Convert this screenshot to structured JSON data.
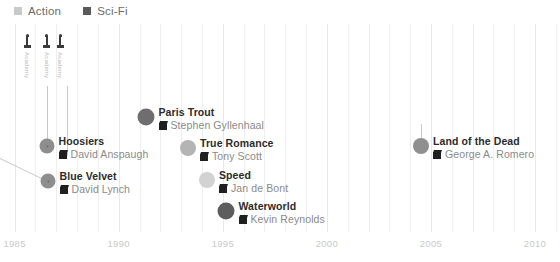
{
  "legend": {
    "items": [
      {
        "label": "Action",
        "color": "#c9c9c9",
        "swatch_icon": "square-swatch-icon"
      },
      {
        "label": "Sci-Fi",
        "color": "#5a5a5a",
        "swatch_icon": "square-swatch-icon"
      }
    ]
  },
  "axis": {
    "ticks": [
      "1985",
      "1990",
      "1995",
      "2000",
      "2005",
      "2010"
    ],
    "xmin": 1984.3,
    "xmax": 2011.2,
    "tick_values": [
      1985,
      1990,
      1995,
      2000,
      2005,
      2010
    ],
    "gridline_years": [
      1984,
      1985,
      1986,
      1987,
      1988,
      1989,
      1990,
      1991,
      1992,
      1993,
      1994,
      1995,
      1996,
      1997,
      1998,
      1999,
      2000,
      2001,
      2002,
      2003,
      2004,
      2005,
      2006,
      2007,
      2008,
      2009,
      2010,
      2011
    ]
  },
  "annotations": {
    "top_icons": [
      {
        "icon": "award-statue-icon",
        "label": "Academy",
        "year": 1985.6
      },
      {
        "icon": "award-statue-icon",
        "label": "Academy",
        "year": 1986.55
      },
      {
        "icon": "award-statue-icon",
        "label": "Academy",
        "year": 1987.2
      }
    ]
  },
  "chart_data": {
    "type": "scatter",
    "title": "",
    "xlabel": "",
    "ylabel": "",
    "xlim": [
      1984.3,
      2011.2
    ],
    "grid": true,
    "legend_position": "top-left",
    "categories": [
      "Action",
      "Sci-Fi"
    ],
    "points": [
      {
        "title": "Paris Trout",
        "director": "Stephen Gyllenhaal",
        "year": 1991,
        "genre": "Sci-Fi",
        "color": "#6e6e6e",
        "x": 146,
        "y": 117,
        "r": 8.5,
        "has_core": false
      },
      {
        "title": "Hoosiers",
        "director": "David Anspaugh",
        "year": 1986,
        "genre": "Action",
        "color": "#8e8e8e",
        "x": 47,
        "y": 146,
        "r": 7.5,
        "has_core": true
      },
      {
        "title": "True Romance",
        "director": "Tony Scott",
        "year": 1993,
        "genre": "Action",
        "color": "#b4b4b4",
        "x": 188,
        "y": 148,
        "r": 8,
        "has_core": false
      },
      {
        "title": "Land of the Dead",
        "director": "George A. Romero",
        "year": 2005,
        "genre": "Action",
        "color": "#909090",
        "x": 421,
        "y": 146,
        "r": 8,
        "has_core": false
      },
      {
        "title": "Blue Velvet",
        "director": "David Lynch",
        "year": 1986,
        "genre": "Action",
        "color": "#8e8e8e",
        "x": 48,
        "y": 181,
        "r": 7.5,
        "has_core": true
      },
      {
        "title": "Speed",
        "director": "Jan de Bont",
        "year": 1994,
        "genre": "Action",
        "color": "#d2d2d2",
        "x": 207,
        "y": 180,
        "r": 8,
        "has_core": false
      },
      {
        "title": "Waterworld",
        "director": "Kevin Reynolds",
        "year": 1995,
        "genre": "Sci-Fi",
        "color": "#5d5d5d",
        "x": 226,
        "y": 211,
        "r": 8.5,
        "has_core": false
      }
    ]
  }
}
